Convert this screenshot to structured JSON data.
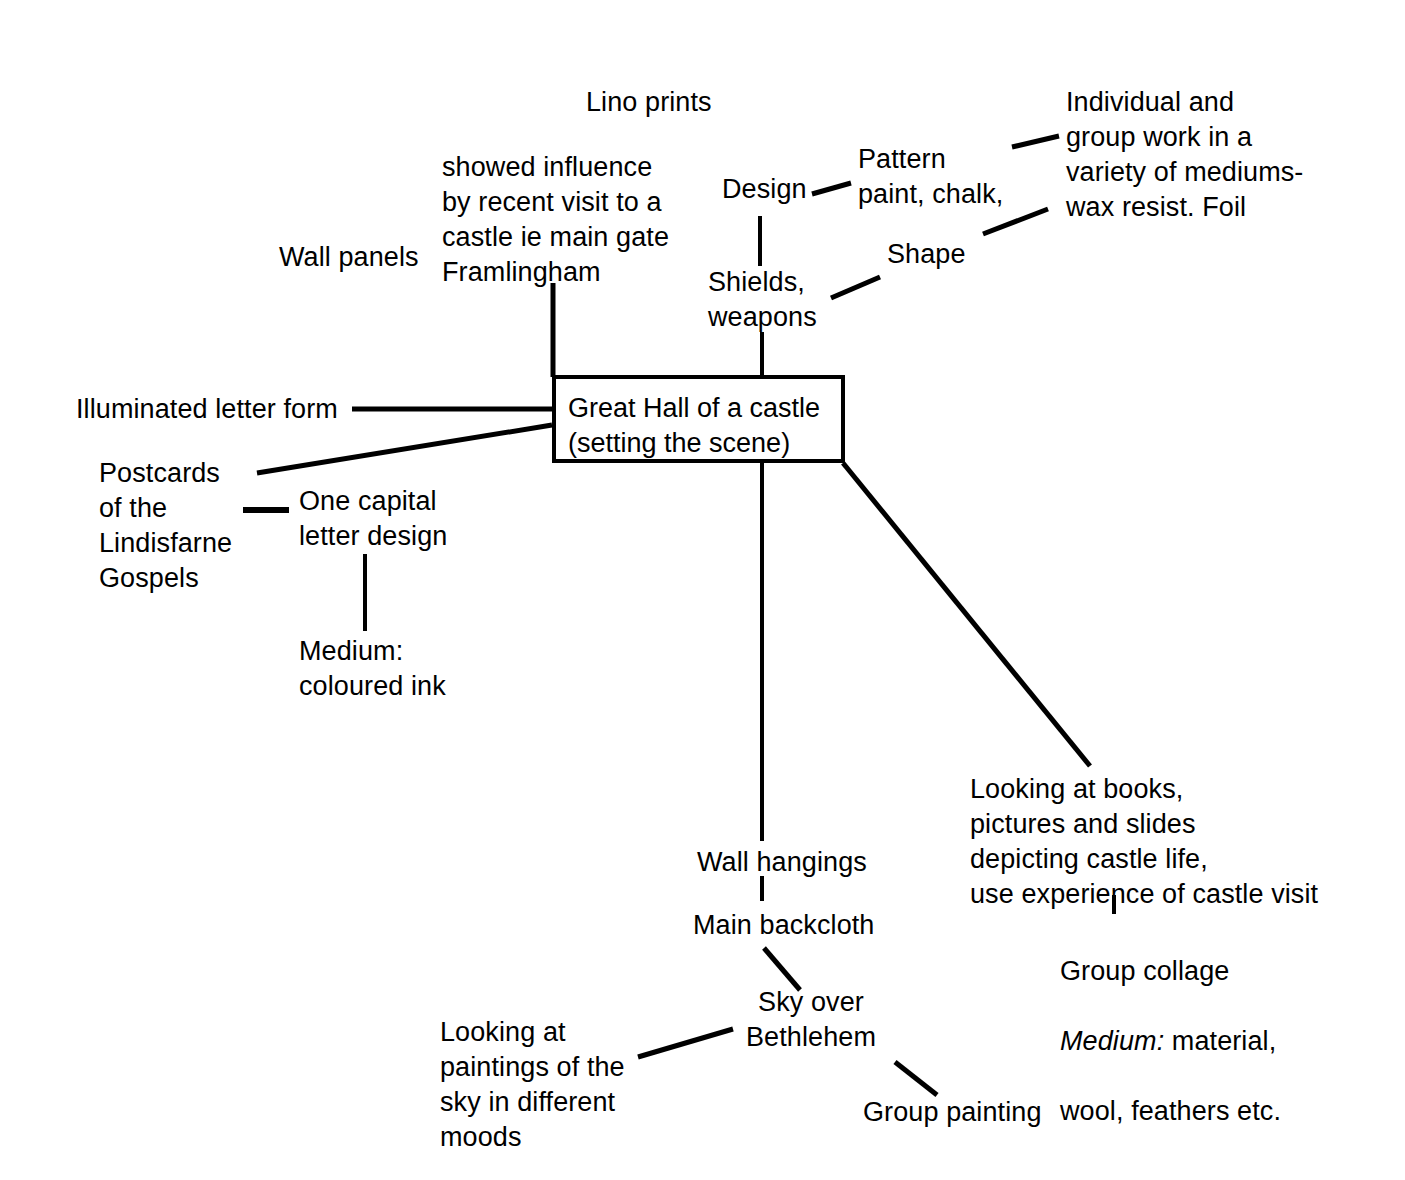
{
  "diagram": {
    "center": {
      "text": "Great Hall of a castle\n(setting the scene)"
    },
    "nodes": {
      "lino_prints": "Lino prints",
      "showed_influence": "showed influence\nby recent visit to a\ncastle ie main gate\nFramlingham",
      "wall_panels": "Wall panels",
      "design": "Design",
      "pattern": "Pattern\npaint, chalk,",
      "individual_group": "Individual and\ngroup work in a\nvariety of mediums-\nwax resist. Foil",
      "shape": "Shape",
      "shields_weapons": "Shields,\nweapons",
      "illuminated_letter_form": "Illuminated letter form",
      "postcards": "Postcards\nof the\nLindisfarne\nGospels",
      "one_capital": "One capital\nletter design",
      "medium_ink": "Medium:\ncoloured ink",
      "looking_at_books": "Looking at books,\npictures and slides\ndepicting castle life,\nuse experience of castle visit",
      "group_collage_line1": "Group collage",
      "group_collage_medium_label": "Medium:",
      "group_collage_medium_rest": " material,",
      "group_collage_line3": "wool, feathers etc.",
      "wall_hangings": "Wall hangings",
      "main_backcloth": "Main backcloth",
      "sky_over_bethlehem": "Sky over\nBethlehem",
      "looking_at_paintings": "Looking at\npaintings of the\nsky in different\nmoods",
      "group_painting": "Group painting"
    },
    "style": {
      "ink": "#000000",
      "background": "#ffffff"
    }
  }
}
